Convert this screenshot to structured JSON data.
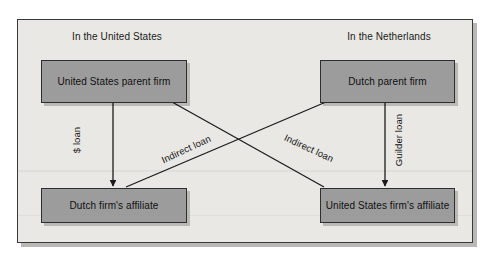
{
  "diagram": {
    "type": "flow-diagram",
    "panel": {
      "background_color": "#e9e8e4",
      "border_color": "#3a3a3a"
    },
    "regions": [
      {
        "id": "united-states",
        "label": "In the United States"
      },
      {
        "id": "netherlands",
        "label": "In the Netherlands"
      }
    ],
    "nodes": [
      {
        "id": "us-parent",
        "label": "United States parent firm",
        "region": "united-states",
        "fill_color": "#9c9c9c"
      },
      {
        "id": "nl-parent",
        "label": "Dutch parent firm",
        "region": "netherlands",
        "fill_color": "#9c9c9c"
      },
      {
        "id": "nl-affil",
        "label": "Dutch firm's affiliate",
        "region": "united-states",
        "fill_color": "#9c9c9c"
      },
      {
        "id": "us-affil",
        "label": "United States firm's affiliate",
        "region": "netherlands",
        "fill_color": "#9c9c9c"
      }
    ],
    "edges": [
      {
        "id": "dollar-loan",
        "label": "$ loan",
        "from": "us-parent",
        "to": "nl-affil",
        "style": "vertical-arrow"
      },
      {
        "id": "guilder-loan",
        "label": "Guilder loan",
        "from": "nl-parent",
        "to": "us-affil",
        "style": "vertical-arrow"
      },
      {
        "id": "indirect-left",
        "label": "Indirect loan",
        "from": "us-parent",
        "to": "us-affil",
        "style": "diagonal"
      },
      {
        "id": "indirect-right",
        "label": "Indirect loan",
        "from": "nl-parent",
        "to": "nl-affil",
        "style": "diagonal"
      }
    ]
  }
}
